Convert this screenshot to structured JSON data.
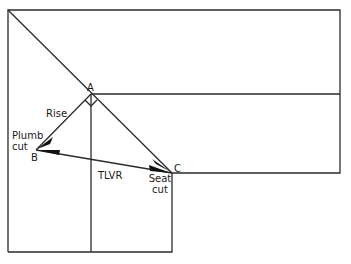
{
  "diagram": {
    "type": "rafter-layout",
    "colors": {
      "line": "#2b2b2b",
      "background": "#ffffff"
    },
    "points": {
      "A": {
        "label": "A",
        "x": 91,
        "y": 94
      },
      "B": {
        "label": "B",
        "x": 36,
        "y": 150
      },
      "C": {
        "label": "C",
        "x": 172,
        "y": 173
      }
    },
    "labels": {
      "rise": "Rise",
      "plumb_cut_line1": "Plumb",
      "plumb_cut_line2": "cut",
      "tlvr": "TLVR",
      "seat_cut_line1": "Seat",
      "seat_cut_line2": "cut"
    },
    "markers": {
      "right_angle_at": "A"
    }
  }
}
